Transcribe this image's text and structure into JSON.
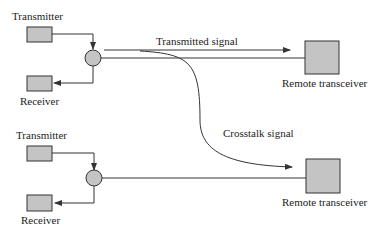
{
  "diagram": {
    "type": "crosstalk-illustration",
    "top_unit": {
      "transmitter_label": "Transmitter",
      "receiver_label": "Receiver",
      "remote_label": "Remote transceiver",
      "signal_label": "Transmitted signal"
    },
    "bottom_unit": {
      "transmitter_label": "Transmitter",
      "receiver_label": "Receiver",
      "remote_label": "Remote transceiver"
    },
    "crosstalk_label": "Crosstalk signal",
    "colors": {
      "box_fill": "#c4c4c4",
      "line": "#333333",
      "background": "#ffffff"
    }
  }
}
